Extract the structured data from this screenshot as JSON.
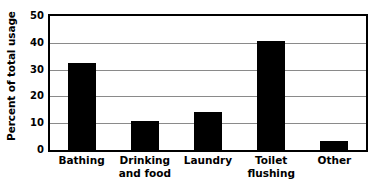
{
  "chart_data": {
    "type": "bar",
    "title": "",
    "subtitle": "",
    "xlabel": "",
    "ylabel": "Percent of total usage",
    "categories": [
      "Bathing",
      "Drinking and food",
      "Laundry",
      "Toilet flushing",
      "Other"
    ],
    "category_lines": [
      [
        "Bathing"
      ],
      [
        "Drinking",
        "and food"
      ],
      [
        "Laundry"
      ],
      [
        "Toilet",
        "flushing"
      ],
      [
        "Other"
      ]
    ],
    "values": [
      32.3,
      11.0,
      14.3,
      40.7,
      3.5
    ],
    "ylim": [
      0,
      50
    ],
    "yticks": [
      0,
      10,
      20,
      30,
      40,
      50
    ],
    "ytick_labels": [
      "0",
      "10",
      "20",
      "30",
      "40",
      "50"
    ],
    "gridlines": [
      10,
      20,
      30,
      40
    ],
    "grid": true,
    "legend": "none",
    "bar_color": "#000000",
    "grid_color": "#8a8a8a",
    "frame_color": "#000000",
    "background_color": "#ffffff"
  }
}
